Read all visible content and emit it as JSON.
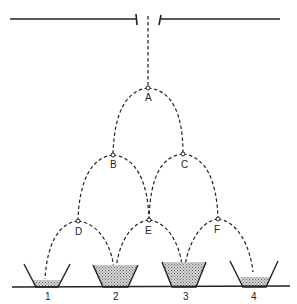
{
  "diagram": {
    "nodes": [
      {
        "id": "A",
        "label": "A"
      },
      {
        "id": "B",
        "label": "B"
      },
      {
        "id": "C",
        "label": "C"
      },
      {
        "id": "D",
        "label": "D"
      },
      {
        "id": "E",
        "label": "E"
      },
      {
        "id": "F",
        "label": "F"
      }
    ],
    "containers": [
      {
        "id": "1",
        "label": "1",
        "fill_level": "low"
      },
      {
        "id": "2",
        "label": "2",
        "fill_level": "high"
      },
      {
        "id": "3",
        "label": "3",
        "fill_level": "high"
      },
      {
        "id": "4",
        "label": "4",
        "fill_level": "low"
      }
    ],
    "edges": [
      [
        "slit",
        "A"
      ],
      [
        "A",
        "B"
      ],
      [
        "A",
        "C"
      ],
      [
        "B",
        "D"
      ],
      [
        "B",
        "E"
      ],
      [
        "C",
        "E"
      ],
      [
        "C",
        "F"
      ],
      [
        "D",
        "1"
      ],
      [
        "D",
        "2"
      ],
      [
        "E",
        "2"
      ],
      [
        "E",
        "3"
      ],
      [
        "F",
        "3"
      ],
      [
        "F",
        "4"
      ]
    ],
    "colors": {
      "line": "#222222",
      "fill": "#bbbbbb"
    }
  }
}
